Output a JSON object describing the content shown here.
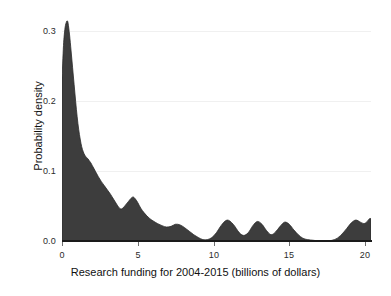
{
  "chart_data": {
    "type": "area",
    "title": "",
    "subtitle": "",
    "xlabel": "Research funding for 2004-2015 (billions of dollars)",
    "ylabel": "Probability density",
    "xlim": [
      0,
      20.4
    ],
    "ylim": [
      0.0,
      0.325
    ],
    "xticks": [
      0,
      5,
      10,
      15,
      20
    ],
    "xticklabels": [
      "0",
      "5",
      "10",
      "15",
      "20"
    ],
    "yticks": [
      0.0,
      0.1,
      0.2,
      0.3
    ],
    "yticklabels": [
      "0.0",
      "0.1",
      "0.2",
      "0.3"
    ],
    "grid": true,
    "legend": null,
    "fill_color": "#3d3d3d",
    "line_color": "#2b2b2b",
    "background_color": "#ffffff",
    "series": [
      {
        "name": "Kernel density estimate of research funding",
        "x": [
          0.0,
          0.1,
          0.2,
          0.3,
          0.35,
          0.4,
          0.5,
          0.6,
          0.7,
          0.8,
          0.9,
          1.0,
          1.1,
          1.2,
          1.3,
          1.4,
          1.5,
          1.6,
          1.7,
          1.8,
          1.9,
          2.0,
          2.2,
          2.4,
          2.6,
          2.8,
          3.0,
          3.2,
          3.4,
          3.6,
          3.8,
          3.95,
          4.1,
          4.25,
          4.4,
          4.55,
          4.7,
          4.85,
          5.0,
          5.2,
          5.4,
          5.6,
          5.8,
          6.0,
          6.3,
          6.6,
          6.9,
          7.2,
          7.5,
          7.8,
          8.1,
          8.4,
          8.7,
          9.0,
          9.3,
          9.6,
          9.9,
          10.2,
          10.5,
          10.9,
          11.3,
          11.7,
          12.0,
          12.3,
          12.6,
          12.9,
          13.2,
          13.5,
          13.8,
          14.1,
          14.4,
          14.7,
          15.0,
          15.3,
          15.6,
          15.9,
          16.2,
          16.6,
          17.0,
          17.5,
          18.0,
          18.4,
          18.8,
          19.1,
          19.4,
          19.7,
          19.95,
          20.15,
          20.3,
          20.4
        ],
        "y": [
          0.23,
          0.28,
          0.305,
          0.314,
          0.315,
          0.312,
          0.295,
          0.272,
          0.248,
          0.224,
          0.2,
          0.178,
          0.16,
          0.146,
          0.135,
          0.128,
          0.123,
          0.12,
          0.118,
          0.115,
          0.112,
          0.108,
          0.1,
          0.092,
          0.085,
          0.079,
          0.073,
          0.067,
          0.06,
          0.053,
          0.047,
          0.046,
          0.049,
          0.053,
          0.057,
          0.061,
          0.063,
          0.06,
          0.055,
          0.047,
          0.041,
          0.036,
          0.032,
          0.029,
          0.025,
          0.022,
          0.02,
          0.021,
          0.024,
          0.023,
          0.019,
          0.014,
          0.009,
          0.005,
          0.002,
          0.002,
          0.005,
          0.012,
          0.022,
          0.03,
          0.024,
          0.012,
          0.008,
          0.012,
          0.022,
          0.028,
          0.024,
          0.015,
          0.009,
          0.013,
          0.021,
          0.027,
          0.024,
          0.016,
          0.009,
          0.004,
          0.002,
          0.001,
          0.0,
          0.0,
          0.002,
          0.008,
          0.018,
          0.026,
          0.03,
          0.027,
          0.025,
          0.028,
          0.032,
          0.032
        ]
      }
    ]
  },
  "axes": {
    "x_title": "Research funding for 2004-2015 (billions of dollars)",
    "y_title": "Probability density",
    "x_tick_labels": [
      "0",
      "5",
      "10",
      "15",
      "20"
    ],
    "y_tick_labels": [
      "0.0",
      "0.1",
      "0.2",
      "0.3"
    ]
  }
}
